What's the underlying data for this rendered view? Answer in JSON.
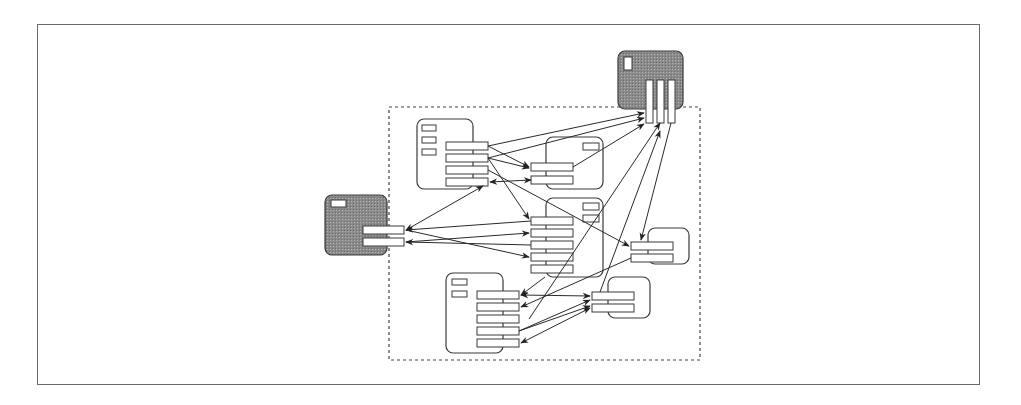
{
  "diagram": {
    "frame": {
      "x": 37,
      "y": 24,
      "w": 943,
      "h": 361
    },
    "group": {
      "x": 389,
      "y": 107,
      "w": 311,
      "h": 253,
      "style": "dashed"
    },
    "colors": {
      "stroke": "#3a3a3a",
      "shaded": "#8e8e8e",
      "background": "#ffffff"
    },
    "nodes": [
      {
        "id": "top-shaded",
        "shaded": true,
        "box": [
          618,
          51,
          65,
          58
        ],
        "tags": [
          [
            624,
            57,
            8,
            13
          ]
        ],
        "ports": [
          [
            646,
            80,
            7,
            43
          ],
          [
            657,
            80,
            7,
            43
          ],
          [
            668,
            80,
            7,
            43
          ]
        ]
      },
      {
        "id": "left-shaded",
        "shaded": true,
        "box": [
          325,
          195,
          62,
          60
        ],
        "tags": [
          [
            331,
            200,
            15,
            7
          ]
        ],
        "ports": [
          [
            363,
            226,
            41,
            8
          ],
          [
            363,
            238,
            41,
            8
          ]
        ]
      },
      {
        "id": "node-a",
        "shaded": false,
        "box": [
          417,
          119,
          56,
          70
        ],
        "tags": [
          [
            422,
            125,
            14,
            6
          ],
          [
            422,
            137,
            14,
            6
          ],
          [
            422,
            149,
            14,
            6
          ]
        ],
        "ports": [
          [
            446,
            142,
            42,
            8
          ],
          [
            446,
            154,
            42,
            8
          ],
          [
            446,
            166,
            42,
            8
          ],
          [
            446,
            178,
            42,
            8
          ]
        ]
      },
      {
        "id": "node-b",
        "shaded": false,
        "box": [
          546,
          137,
          57,
          52
        ],
        "tags": [
          [
            583,
            143,
            16,
            7
          ]
        ],
        "ports": [
          [
            531,
            163,
            42,
            8
          ],
          [
            531,
            176,
            42,
            8
          ]
        ]
      },
      {
        "id": "node-c",
        "shaded": false,
        "box": [
          546,
          198,
          57,
          79
        ],
        "tags": [
          [
            583,
            203,
            16,
            7
          ],
          [
            583,
            215,
            16,
            7
          ]
        ],
        "ports": [
          [
            531,
            217,
            42,
            8
          ],
          [
            531,
            229,
            42,
            8
          ],
          [
            531,
            241,
            42,
            8
          ],
          [
            531,
            253,
            42,
            8
          ],
          [
            531,
            265,
            42,
            8
          ]
        ]
      },
      {
        "id": "node-d",
        "shaded": false,
        "box": [
          648,
          228,
          41,
          36
        ],
        "tags": [],
        "ports": [
          [
            631,
            242,
            42,
            8
          ],
          [
            631,
            254,
            42,
            8
          ]
        ]
      },
      {
        "id": "node-e",
        "shaded": false,
        "box": [
          608,
          277,
          42,
          41
        ],
        "tags": [],
        "ports": [
          [
            592,
            292,
            42,
            8
          ],
          [
            592,
            304,
            42,
            8
          ]
        ]
      },
      {
        "id": "node-f",
        "shaded": false,
        "box": [
          446,
          273,
          57,
          80
        ],
        "tags": [
          [
            452,
            279,
            15,
            6
          ],
          [
            452,
            291,
            15,
            6
          ]
        ],
        "ports": [
          [
            477,
            291,
            42,
            8
          ],
          [
            477,
            303,
            42,
            8
          ],
          [
            477,
            315,
            42,
            8
          ],
          [
            477,
            327,
            42,
            8
          ],
          [
            477,
            339,
            42,
            8
          ]
        ]
      }
    ],
    "edges": [
      {
        "from": [
          488,
          146
        ],
        "to": [
          644,
          113
        ],
        "arrow": "end"
      },
      {
        "from": [
          488,
          158
        ],
        "to": [
          644,
          118
        ],
        "arrow": "end"
      },
      {
        "from": [
          573,
          167
        ],
        "to": [
          644,
          124
        ],
        "arrow": "end"
      },
      {
        "from": [
          488,
          146
        ],
        "to": [
          529,
          167
        ],
        "arrow": "end"
      },
      {
        "from": [
          488,
          158
        ],
        "to": [
          529,
          168
        ],
        "arrow": "end"
      },
      {
        "from": [
          531,
          180
        ],
        "to": [
          490,
          182
        ],
        "arrow": "both"
      },
      {
        "from": [
          488,
          158
        ],
        "to": [
          529,
          219
        ],
        "arrow": "end"
      },
      {
        "from": [
          488,
          170
        ],
        "to": [
          629,
          246
        ],
        "arrow": "end"
      },
      {
        "from": [
          406,
          230
        ],
        "to": [
          483,
          186
        ],
        "arrow": "both"
      },
      {
        "from": [
          531,
          221
        ],
        "to": [
          406,
          230
        ],
        "arrow": "end"
      },
      {
        "from": [
          406,
          230
        ],
        "to": [
          529,
          257
        ],
        "arrow": "end"
      },
      {
        "from": [
          406,
          242
        ],
        "to": [
          529,
          233
        ],
        "arrow": "end"
      },
      {
        "from": [
          531,
          245
        ],
        "to": [
          406,
          242
        ],
        "arrow": "end"
      },
      {
        "from": [
          545,
          277
        ],
        "to": [
          521,
          295
        ],
        "arrow": "end"
      },
      {
        "from": [
          631,
          258
        ],
        "to": [
          521,
          307
        ],
        "arrow": "end"
      },
      {
        "from": [
          660,
          123
        ],
        "to": [
          529,
          319
        ],
        "arrow": "start"
      },
      {
        "from": [
          671,
          123
        ],
        "to": [
          641,
          240
        ],
        "arrow": "end"
      },
      {
        "from": [
          521,
          295
        ],
        "to": [
          590,
          296
        ],
        "arrow": "both"
      },
      {
        "from": [
          600,
          292
        ],
        "to": [
          660,
          131
        ],
        "arrow": "end"
      },
      {
        "from": [
          519,
          331
        ],
        "to": [
          590,
          300
        ],
        "arrow": "end"
      },
      {
        "from": [
          519,
          331
        ],
        "to": [
          590,
          306
        ],
        "arrow": "end"
      },
      {
        "from": [
          521,
          343
        ],
        "to": [
          590,
          308
        ],
        "arrow": "both"
      }
    ]
  }
}
